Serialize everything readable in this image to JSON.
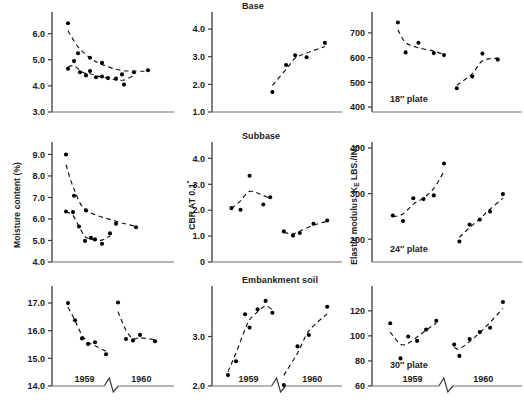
{
  "figure": {
    "width": 524,
    "height": 419,
    "background": "#ffffff",
    "ink": "#1a1a1a",
    "marker_color": "#000000",
    "trend_style": "dashed"
  },
  "columns": [
    {
      "key": "moisture",
      "title": "",
      "ylabel_plain": "Moisture content (%)"
    },
    {
      "key": "cbr",
      "title": "",
      "ylabel_plain": "CBR AT 0.1\""
    },
    {
      "key": "modulus",
      "title": "",
      "ylabel_plain": "Elastic modulus, KE LBS./IN3"
    }
  ],
  "row_titles": [
    "Base",
    "Subbase",
    "Embankment soil"
  ],
  "year_labels": [
    "1959",
    "1960"
  ],
  "plate_labels": [
    "18″ plate",
    "24″ plate",
    "30″ plate"
  ],
  "chart_data": [
    {
      "id": "moisture-base",
      "type": "scatter",
      "title": "",
      "row": "Base",
      "column": "Moisture content (%)",
      "xlabel": "",
      "ylabel": "Moisture content (%)",
      "ylim": [
        3.0,
        6.6
      ],
      "yticks": [
        3.0,
        4.0,
        5.0,
        6.0
      ],
      "yticklabels": [
        "3.0",
        "4.0",
        "5.0",
        "6.0"
      ],
      "grid": false,
      "axis_break": true,
      "series": [
        {
          "name": "1959",
          "x": [
            0.08,
            0.14,
            0.2,
            0.26,
            0.3,
            0.36,
            0.42,
            0.48,
            0.56,
            0.64,
            0.74
          ],
          "y": [
            4.66,
            4.95,
            4.52,
            4.4,
            4.57,
            4.33,
            4.36,
            4.3,
            4.28,
            4.05,
            4.52
          ]
        },
        {
          "name": "1960",
          "x": [
            0.08,
            0.18,
            0.3,
            0.42,
            0.62,
            0.88
          ],
          "y": [
            6.4,
            5.25,
            5.08,
            4.88,
            4.44,
            4.6
          ]
        }
      ],
      "trend": "decaying"
    },
    {
      "id": "cbr-base",
      "type": "scatter",
      "title": "Base",
      "row": "Base",
      "column": "CBR AT 0.1\"",
      "xlabel": "",
      "ylabel": "CBR AT 0.1\"",
      "ylim": [
        1.0,
        4.4
      ],
      "yticks": [
        1.0,
        2.0,
        3.0,
        4.0
      ],
      "yticklabels": [
        "1.0",
        "2.0",
        "3.0",
        "4.0"
      ],
      "grid": false,
      "axis_break": true,
      "series": [
        {
          "name": "1960",
          "x": [
            0.46,
            0.58,
            0.66,
            0.76,
            0.92
          ],
          "y": [
            1.72,
            2.7,
            3.05,
            2.98,
            3.5
          ]
        }
      ],
      "trend": "rising"
    },
    {
      "id": "modulus-base",
      "type": "scatter",
      "title": "",
      "row": "Base",
      "column": "Elastic modulus, KE LBS./IN3",
      "xlabel": "",
      "ylabel": "Elastic modulus, KE LBS./IN3",
      "ylim": [
        380,
        760
      ],
      "yticks": [
        400,
        500,
        600,
        700
      ],
      "yticklabels": [
        "400",
        "500",
        "600",
        "700"
      ],
      "annotation": "18″ plate",
      "grid": false,
      "axis_break": true,
      "series": [
        {
          "name": "1959",
          "x": [
            0.14,
            0.2,
            0.3,
            0.42,
            0.5
          ],
          "y": [
            742,
            621,
            660,
            618,
            610
          ]
        },
        {
          "name": "1960",
          "x": [
            0.6,
            0.72,
            0.8,
            0.92
          ],
          "y": [
            476,
            523,
            616,
            592
          ]
        }
      ],
      "trend": "mixed"
    },
    {
      "id": "moisture-subbase",
      "type": "scatter",
      "title": "",
      "row": "Subbase",
      "column": "Moisture content (%)",
      "xlabel": "",
      "ylabel": "Moisture content (%)",
      "ylim": [
        4.0,
        9.3
      ],
      "yticks": [
        4.0,
        5.0,
        6.0,
        7.0,
        8.0,
        9.0
      ],
      "yticklabels": [
        "4.0",
        "5.0",
        "6.0",
        "7.0",
        "8.0",
        "9.0"
      ],
      "grid": false,
      "axis_break": true,
      "series": [
        {
          "name": "1959",
          "x": [
            0.06,
            0.13,
            0.19,
            0.25,
            0.31,
            0.35,
            0.42,
            0.5
          ],
          "y": [
            6.35,
            6.32,
            5.65,
            4.98,
            5.12,
            5.05,
            4.85,
            5.33
          ]
        },
        {
          "name": "1960",
          "x": [
            0.06,
            0.14,
            0.26,
            0.56,
            0.76
          ],
          "y": [
            9.0,
            7.08,
            6.4,
            5.78,
            5.62
          ]
        }
      ],
      "trend": "decaying"
    },
    {
      "id": "cbr-subbase",
      "type": "scatter",
      "title": "Subbase",
      "row": "Subbase",
      "column": "CBR AT 0.1\"",
      "xlabel": "",
      "ylabel": "CBR AT 0.1\"",
      "ylim": [
        0,
        4.4
      ],
      "yticks": [
        0,
        1.0,
        2.0,
        3.0,
        4.0
      ],
      "yticklabels": [
        "0",
        "1.0",
        "2.0",
        "3.0",
        "4.0"
      ],
      "grid": false,
      "axis_break": true,
      "series": [
        {
          "name": "1959",
          "x": [
            0.1,
            0.18,
            0.26,
            0.38,
            0.44
          ],
          "y": [
            2.08,
            2.02,
            3.33,
            2.22,
            2.5
          ]
        },
        {
          "name": "1960",
          "x": [
            0.56,
            0.64,
            0.7,
            0.82,
            0.94
          ],
          "y": [
            1.18,
            1.02,
            1.12,
            1.48,
            1.6
          ]
        }
      ],
      "trend": "rising"
    },
    {
      "id": "modulus-subbase",
      "type": "scatter",
      "title": "",
      "row": "Subbase",
      "column": "Elastic modulus, KE LBS./IN3",
      "xlabel": "",
      "ylabel": "Elastic modulus, KE LBS./IN3",
      "ylim": [
        150,
        400
      ],
      "yticks": [
        200,
        300,
        400
      ],
      "yticklabels": [
        "200",
        "300",
        "400"
      ],
      "annotation": "24″ plate",
      "grid": false,
      "axis_break": true,
      "series": [
        {
          "name": "1959",
          "x": [
            0.1,
            0.18,
            0.26,
            0.34,
            0.42,
            0.5
          ],
          "y": [
            252,
            240,
            290,
            288,
            296,
            366
          ]
        },
        {
          "name": "1960",
          "x": [
            0.62,
            0.7,
            0.78,
            0.86,
            0.96
          ],
          "y": [
            195,
            232,
            243,
            261,
            299
          ]
        }
      ],
      "trend": "rising"
    },
    {
      "id": "moisture-embankment",
      "type": "scatter",
      "title": "",
      "row": "Embankment soil",
      "column": "Moisture content (%)",
      "xlabel": "",
      "ylabel": "Moisture content (%)",
      "ylim": [
        14.0,
        17.4
      ],
      "yticks": [
        14.0,
        15.0,
        16.0,
        17.0
      ],
      "yticklabels": [
        "14.0",
        "15.0",
        "16.0",
        "17.0"
      ],
      "grid": false,
      "axis_break": true,
      "series": [
        {
          "name": "1959",
          "x": [
            0.08,
            0.15,
            0.22,
            0.28,
            0.35,
            0.46
          ],
          "y": [
            17.0,
            16.38,
            15.72,
            15.52,
            15.58,
            15.15
          ]
        },
        {
          "name": "1960",
          "x": [
            0.58,
            0.66,
            0.73,
            0.8,
            0.95
          ],
          "y": [
            17.02,
            15.7,
            15.65,
            15.85,
            15.62
          ]
        }
      ],
      "trend": "decaying"
    },
    {
      "id": "cbr-embankment",
      "type": "scatter",
      "title": "Embankment soil",
      "row": "Embankment soil",
      "column": "CBR AT 0.1\"",
      "xlabel": "",
      "ylabel": "CBR AT 0.1\"",
      "ylim": [
        2.0,
        3.9
      ],
      "yticks": [
        2.0,
        3.0
      ],
      "yticklabels": [
        "2.0",
        "3.0"
      ],
      "grid": false,
      "axis_break": true,
      "series": [
        {
          "name": "1959",
          "x": [
            0.07,
            0.14,
            0.22,
            0.26,
            0.33,
            0.4,
            0.46
          ],
          "y": [
            2.22,
            2.5,
            3.45,
            3.18,
            3.55,
            3.72,
            3.48
          ]
        },
        {
          "name": "1960",
          "x": [
            0.56,
            0.68,
            0.78,
            0.94
          ],
          "y": [
            2.02,
            2.8,
            3.03,
            3.6
          ]
        }
      ],
      "trend": "rising"
    },
    {
      "id": "modulus-embankment",
      "type": "scatter",
      "title": "",
      "row": "Embankment soil",
      "column": "Elastic modulus, KE LBS./IN3",
      "xlabel": "",
      "ylabel": "Elastic modulus, KE LBS./IN3",
      "ylim": [
        60,
        135
      ],
      "yticks": [
        60,
        80,
        100,
        120
      ],
      "yticklabels": [
        "60",
        "80",
        "100",
        "120"
      ],
      "annotation": "30″ plate",
      "grid": false,
      "axis_break": true,
      "series": [
        {
          "name": "1959",
          "x": [
            0.08,
            0.16,
            0.22,
            0.29,
            0.36,
            0.44
          ],
          "y": [
            110,
            82,
            99.5,
            96,
            105,
            112
          ]
        },
        {
          "name": "1960",
          "x": [
            0.58,
            0.62,
            0.7,
            0.78,
            0.86,
            0.96
          ],
          "y": [
            93,
            84,
            97.5,
            103,
            106.5,
            127
          ]
        }
      ],
      "trend": "rising"
    }
  ]
}
